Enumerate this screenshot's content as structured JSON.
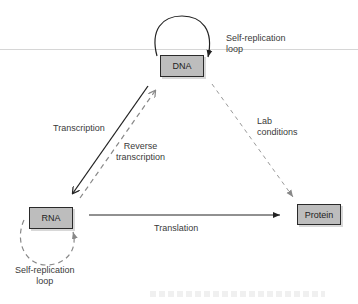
{
  "diagram": {
    "type": "flow-diagram",
    "title": "",
    "nodes": [
      {
        "id": "dna",
        "label": "DNA"
      },
      {
        "id": "rna",
        "label": "RNA"
      },
      {
        "id": "protein",
        "label": "Protein"
      }
    ],
    "edges": [
      {
        "from": "dna",
        "to": "dna",
        "label": "Self-replication loop",
        "style": "solid"
      },
      {
        "from": "dna",
        "to": "rna",
        "label": "Transcription",
        "style": "solid"
      },
      {
        "from": "rna",
        "to": "dna",
        "label": "Reverse transcription",
        "style": "dashed"
      },
      {
        "from": "dna",
        "to": "protein",
        "label": "Lab conditions",
        "style": "dashed"
      },
      {
        "from": "rna",
        "to": "protein",
        "label": "Translation",
        "style": "solid"
      },
      {
        "from": "rna",
        "to": "rna",
        "label": "Self-replication loop",
        "style": "dashed"
      }
    ]
  },
  "labels": {
    "dna_loop_line1": "Self-replication",
    "dna_loop_line2": "loop",
    "transcription": "Transcription",
    "reverse_line1": "Reverse",
    "reverse_line2": "transcription",
    "lab_line1": "Lab",
    "lab_line2": "conditions",
    "translation": "Translation",
    "rna_loop_line1": "Self-replication",
    "rna_loop_line2": "loop"
  },
  "colors": {
    "node_fill": "#bdbdbd",
    "node_border": "#2a2a2a",
    "solid_arrow": "#222222",
    "dashed_arrow": "#8a8a8a"
  }
}
